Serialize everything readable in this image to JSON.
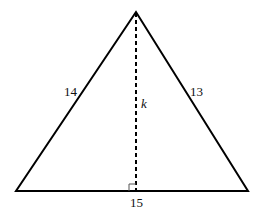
{
  "diagram": {
    "type": "triangle-with-altitude",
    "vertices": {
      "apex": [
        136,
        12
      ],
      "base_left": [
        16,
        191
      ],
      "base_right": [
        248,
        191
      ]
    },
    "altitude_foot": [
      136,
      191
    ],
    "labels": {
      "left_side": "14",
      "right_side": "13",
      "base": "15",
      "altitude": "k"
    },
    "colors": {
      "stroke": "#000000",
      "right_angle_marker": "#555555",
      "background": "#ffffff"
    }
  }
}
